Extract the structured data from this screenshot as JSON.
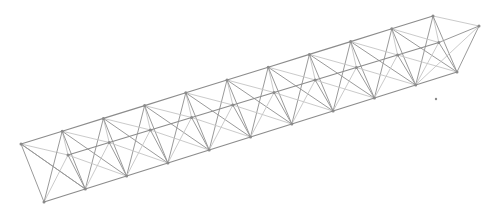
{
  "diagram": {
    "type": "3d-truss-wireframe",
    "bays": 10,
    "colors": {
      "background": "#ffffff",
      "chord": "#8c8c8c",
      "web": "#9a9a9a",
      "light": "#c4c4c4",
      "node": "#8a8a8a"
    },
    "chords": {
      "top_front": {
        "start": [
          21,
          144
        ],
        "step": [
          41.2,
          -12.8
        ],
        "count": 11
      },
      "top_back": {
        "start": [
          68,
          155
        ],
        "step": [
          41.2,
          -12.5
        ],
        "count": 10
      },
      "bottom": {
        "start": [
          44,
          202
        ],
        "step": [
          41.3,
          -13.0
        ],
        "count": 11
      }
    },
    "end_node_right": [
      479,
      26
    ],
    "stray_point": [
      436,
      99
    ]
  }
}
